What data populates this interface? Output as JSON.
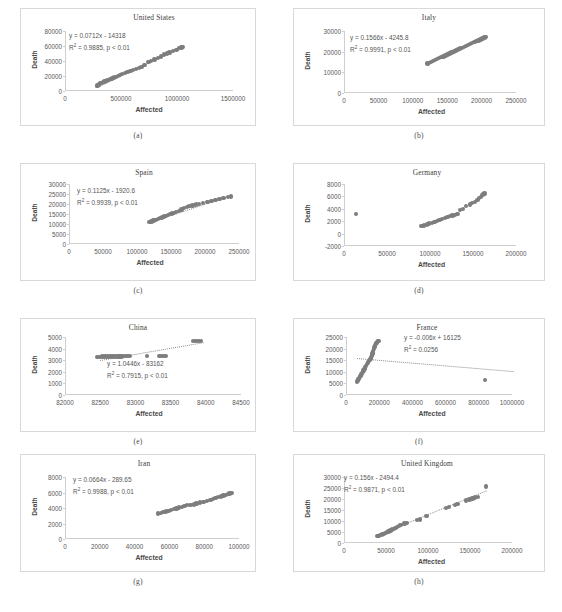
{
  "figure": {
    "panel_count": 8,
    "marker_color": "#7d7d7d",
    "trendline_color": "#8a8a8a",
    "panel_border_color": "#d8d8d8",
    "axis_color": "#cfcfcf"
  },
  "chart_data": [
    {
      "id": "a",
      "caption": "(a)",
      "type": "scatter",
      "title": "United States",
      "xlabel": "Affected",
      "ylabel": "Death",
      "xlim": [
        0,
        1500000
      ],
      "ylim": [
        0,
        80000
      ],
      "xticks": [
        0,
        500000,
        1000000,
        1500000
      ],
      "yticks": [
        0,
        20000,
        40000,
        60000,
        80000
      ],
      "equation": "y = 0.0712x - 14318",
      "r2_label": "R",
      "r2_value": " = 0.9885,  p < 0.01",
      "r2": 0.9885,
      "slope": 0.0712,
      "intercept": -14318,
      "p_value": "p < 0.01",
      "x": [
        275000,
        281000,
        289000,
        297000,
        305000,
        312000,
        320000,
        330000,
        342000,
        355000,
        368000,
        382000,
        396000,
        412000,
        428000,
        445000,
        462000,
        480000,
        500000,
        525000,
        550000,
        575000,
        600000,
        625000,
        650000,
        675000,
        700000,
        735000,
        760000,
        790000,
        820000,
        850000,
        875000,
        900000,
        925000,
        955000,
        985000,
        1010000,
        1030000,
        1045000
      ],
      "y": [
        7000,
        7600,
        8200,
        9000,
        9800,
        10400,
        11000,
        11800,
        12600,
        13400,
        14200,
        15000,
        15800,
        16700,
        17800,
        18800,
        19800,
        21000,
        22400,
        23800,
        25200,
        26600,
        28000,
        29300,
        30600,
        32200,
        34500,
        38500,
        40000,
        42000,
        44000,
        46000,
        48500,
        50000,
        51500,
        53500,
        55000,
        57000,
        58000,
        58500
      ]
    },
    {
      "id": "b",
      "caption": "(b)",
      "type": "scatter",
      "title": "Italy",
      "xlabel": "Affected",
      "ylabel": "Death",
      "xlim": [
        0,
        250000
      ],
      "ylim": [
        0,
        30000
      ],
      "xticks": [
        0,
        50000,
        100000,
        150000,
        200000,
        250000
      ],
      "yticks": [
        0,
        10000,
        20000,
        30000
      ],
      "equation": "y = 0.1566x - 4245.8",
      "r2_label": "R",
      "r2_value": " = 0.9991, p < 0.01",
      "r2": 0.9991,
      "slope": 0.1566,
      "intercept": -4245.8,
      "p_value": "p < 0.01",
      "x": [
        120000,
        122500,
        125000,
        128000,
        131000,
        134000,
        137000,
        140000,
        143000,
        146000,
        149000,
        152000,
        155000,
        158000,
        161000,
        164000,
        167000,
        170000,
        173000,
        176000,
        179000,
        182000,
        185000,
        188000,
        191000,
        194000,
        197000,
        200000,
        203000,
        205000
      ],
      "y": [
        14200,
        14600,
        15000,
        15500,
        15950,
        16400,
        16850,
        17300,
        17750,
        18200,
        18700,
        19150,
        19600,
        20050,
        20500,
        21000,
        21450,
        21900,
        22350,
        22800,
        23250,
        23700,
        24150,
        24600,
        25050,
        25500,
        25950,
        26400,
        26800,
        27000
      ]
    },
    {
      "id": "c",
      "caption": "(c)",
      "type": "scatter",
      "title": "Spain",
      "xlabel": "Affected",
      "ylabel": "Death",
      "xlim": [
        0,
        250000
      ],
      "ylim": [
        0,
        30000
      ],
      "xticks": [
        0,
        50000,
        100000,
        150000,
        200000,
        250000
      ],
      "yticks": [
        0,
        5000,
        10000,
        15000,
        20000,
        25000,
        30000
      ],
      "equation": "y = 0.1125x - 1920.6",
      "r2_label": "R",
      "r2_value": " = 0.9939, p < 0.01",
      "r2": 0.9939,
      "slope": 0.1125,
      "intercept": -1920.6,
      "p_value": "p < 0.01",
      "x": [
        117000,
        120000,
        123000,
        126000,
        129000,
        132000,
        135000,
        138000,
        141000,
        144000,
        147000,
        150000,
        153000,
        156000,
        160000,
        164000,
        168000,
        172000,
        176000,
        180000,
        185000,
        190000,
        196000,
        202000,
        208000,
        214000,
        220000,
        226000,
        232000,
        237000
      ],
      "y": [
        10900,
        11300,
        11700,
        12100,
        12500,
        12900,
        13300,
        13700,
        14100,
        14500,
        14900,
        15300,
        15600,
        15900,
        16600,
        17200,
        17900,
        18400,
        18900,
        19300,
        19700,
        20100,
        20600,
        21100,
        21600,
        22100,
        22600,
        23100,
        23500,
        23800
      ]
    },
    {
      "id": "d",
      "caption": "(d)",
      "type": "scatter",
      "title": "Germany",
      "xlabel": "Affected",
      "ylabel": "Death",
      "xlim": [
        0,
        200000
      ],
      "ylim": [
        -2000,
        8000
      ],
      "xticks": [
        0,
        50000,
        100000,
        150000,
        200000
      ],
      "yticks": [
        -2000,
        0,
        2000,
        4000,
        6000,
        8000
      ],
      "equation": "",
      "r2_label": "",
      "r2_value": "",
      "p_value": "",
      "x": [
        13000,
        89000,
        92000,
        95000,
        98000,
        101000,
        104000,
        107000,
        110000,
        113000,
        116000,
        119000,
        122000,
        125000,
        128000,
        131000,
        134000,
        137000,
        141000,
        145000,
        148000,
        151000,
        154000,
        156000,
        158000,
        160000,
        161000,
        162000
      ],
      "y": [
        3200,
        1200,
        1300,
        1450,
        1600,
        1750,
        1900,
        2050,
        2200,
        2350,
        2500,
        2650,
        2800,
        2950,
        3050,
        3200,
        3850,
        3950,
        4500,
        4700,
        4900,
        5100,
        5400,
        5700,
        5950,
        6200,
        6350,
        6450
      ]
    },
    {
      "id": "e",
      "caption": "(e)",
      "type": "scatter",
      "title": "China",
      "xlabel": "Affected",
      "ylabel": "Death",
      "xlim": [
        82000,
        84500
      ],
      "ylim": [
        0,
        5000
      ],
      "xticks": [
        82000,
        82500,
        83000,
        83500,
        84000,
        84500
      ],
      "yticks": [
        0,
        1000,
        2000,
        3000,
        4000,
        5000
      ],
      "equation": "y = 1.0446x - 83162",
      "r2_label": "R",
      "r2_value": " = 0.7915, p < 0.01",
      "r2": 0.7915,
      "slope": 1.0446,
      "intercept": -83162,
      "p_value": "p < 0.01",
      "x": [
        82450,
        82480,
        82510,
        82540,
        82570,
        82600,
        82630,
        82660,
        82700,
        82730,
        82760,
        82790,
        82820,
        82850,
        82880,
        82910,
        83150,
        83330,
        83360,
        83390,
        83420,
        83800,
        83830,
        83860,
        83890,
        83920
      ],
      "y": [
        3300,
        3300,
        3310,
        3310,
        3320,
        3320,
        3320,
        3320,
        3330,
        3330,
        3330,
        3330,
        3340,
        3340,
        3340,
        3340,
        3340,
        3340,
        3345,
        3345,
        3350,
        4630,
        4635,
        4640,
        4640,
        4645
      ]
    },
    {
      "id": "f",
      "caption": "(f)",
      "type": "scatter",
      "title": "France",
      "xlabel": "Affected",
      "ylabel": "Death",
      "xlim": [
        0,
        1000000
      ],
      "ylim": [
        0,
        25000
      ],
      "xticks": [
        0,
        200000,
        400000,
        600000,
        800000,
        1000000
      ],
      "yticks": [
        0,
        5000,
        10000,
        15000,
        20000,
        25000
      ],
      "equation": "y = -0.006x + 16125",
      "r2_label": "R",
      "r2_value": " = 0.0256",
      "r2": 0.0256,
      "slope": -0.006,
      "intercept": 16125,
      "p_value": "",
      "x": [
        62000,
        66000,
        70000,
        74000,
        78000,
        82000,
        86000,
        90000,
        95000,
        100000,
        105000,
        110000,
        116000,
        122000,
        128000,
        133000,
        138000,
        142000,
        146000,
        150000,
        154000,
        158000,
        162000,
        166000,
        170000,
        174000,
        178000,
        182000,
        186000,
        190000,
        830000
      ],
      "y": [
        5900,
        6300,
        6800,
        7300,
        7800,
        8300,
        8800,
        9300,
        10000,
        10600,
        11200,
        11800,
        12600,
        13300,
        14000,
        14600,
        15100,
        15600,
        16200,
        17000,
        17900,
        18800,
        19700,
        20600,
        21400,
        22000,
        22500,
        22900,
        23200,
        23400,
        6400
      ]
    },
    {
      "id": "g",
      "caption": "(g)",
      "type": "scatter",
      "title": "Iran",
      "xlabel": "Affected",
      "ylabel": "Death",
      "xlim": [
        0,
        100000
      ],
      "ylim": [
        0,
        8000
      ],
      "xticks": [
        0,
        20000,
        40000,
        60000,
        80000,
        100000
      ],
      "yticks": [
        0,
        2000,
        4000,
        6000,
        8000
      ],
      "equation": "y = 0.0664x - 289.65",
      "r2_label": "R",
      "r2_value": " = 0.9988, p < 0.01",
      "r2": 0.9988,
      "slope": 0.0664,
      "intercept": -289.65,
      "p_value": "p < 0.01",
      "x": [
        53000,
        54500,
        56000,
        57500,
        59000,
        60500,
        62000,
        63500,
        65000,
        66500,
        68000,
        69500,
        71500,
        73500,
        75000,
        77000,
        79000,
        81000,
        83000,
        84500,
        86000,
        87500,
        89000,
        90500,
        92000,
        93000,
        94000,
        95000
      ],
      "y": [
        3300,
        3350,
        3450,
        3550,
        3650,
        3750,
        3850,
        3950,
        4050,
        4150,
        4250,
        4350,
        4400,
        4450,
        4600,
        4700,
        4800,
        4900,
        5050,
        5200,
        5300,
        5400,
        5500,
        5600,
        5700,
        5800,
        5870,
        5900
      ]
    },
    {
      "id": "h",
      "caption": "(h)",
      "type": "scatter",
      "title": "United Kingdom",
      "xlabel": "Affected",
      "ylabel": "Death",
      "xlim": [
        0,
        200000
      ],
      "ylim": [
        0,
        30000
      ],
      "xticks": [
        0,
        50000,
        100000,
        150000,
        200000
      ],
      "yticks": [
        0,
        5000,
        10000,
        15000,
        20000,
        25000,
        30000
      ],
      "equation": "y = 0.156x - 2494.4",
      "r2_label": "R",
      "r2_value": " = 0.9871, p < 0.01",
      "r2": 0.9871,
      "slope": 0.156,
      "intercept": -2494.4,
      "p_value": "p < 0.01",
      "x": [
        38000,
        40000,
        42000,
        44000,
        46000,
        48000,
        50000,
        52000,
        54000,
        56000,
        58000,
        60000,
        62000,
        64000,
        66000,
        71000,
        74000,
        86000,
        89000,
        97000,
        120000,
        124000,
        131000,
        134000,
        144000,
        148000,
        152000,
        155000,
        158000,
        168000
      ],
      "y": [
        3100,
        3300,
        3600,
        3900,
        4200,
        4500,
        4900,
        5300,
        5700,
        6100,
        6500,
        6900,
        7300,
        7700,
        8100,
        8800,
        9000,
        10400,
        10700,
        12200,
        15800,
        16400,
        17300,
        17700,
        19400,
        19800,
        20200,
        20600,
        20900,
        25700
      ]
    }
  ]
}
